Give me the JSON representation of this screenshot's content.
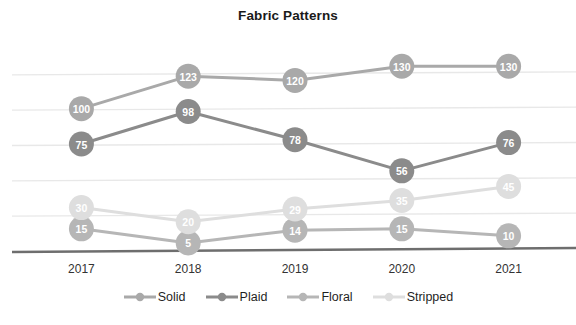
{
  "chart_data": {
    "type": "line",
    "title": "Fabric Patterns",
    "xlabel": "",
    "ylabel": "",
    "categories": [
      "2017",
      "2018",
      "2019",
      "2020",
      "2021"
    ],
    "series": [
      {
        "name": "Solid",
        "values": [
          100,
          123,
          120,
          130,
          130
        ],
        "color": "#a9a9a9"
      },
      {
        "name": "Plaid",
        "values": [
          75,
          98,
          78,
          56,
          76
        ],
        "color": "#8b8b8b"
      },
      {
        "name": "Floral",
        "values": [
          15,
          5,
          14,
          15,
          10
        ],
        "color": "#b6b6b6"
      },
      {
        "name": "Stripped",
        "values": [
          30,
          20,
          29,
          35,
          45
        ],
        "color": "#dedede"
      }
    ],
    "ylim": [
      0,
      150
    ],
    "grid": true,
    "gridlines": [
      25,
      50,
      75,
      100,
      125
    ],
    "legend_position": "bottom",
    "data_labels": true,
    "axis_line_color": "#6e6e6e",
    "grid_color": "#e8e8e8"
  },
  "legend": {
    "items": [
      {
        "label": "Solid"
      },
      {
        "label": "Plaid"
      },
      {
        "label": "Floral"
      },
      {
        "label": "Stripped"
      }
    ]
  }
}
